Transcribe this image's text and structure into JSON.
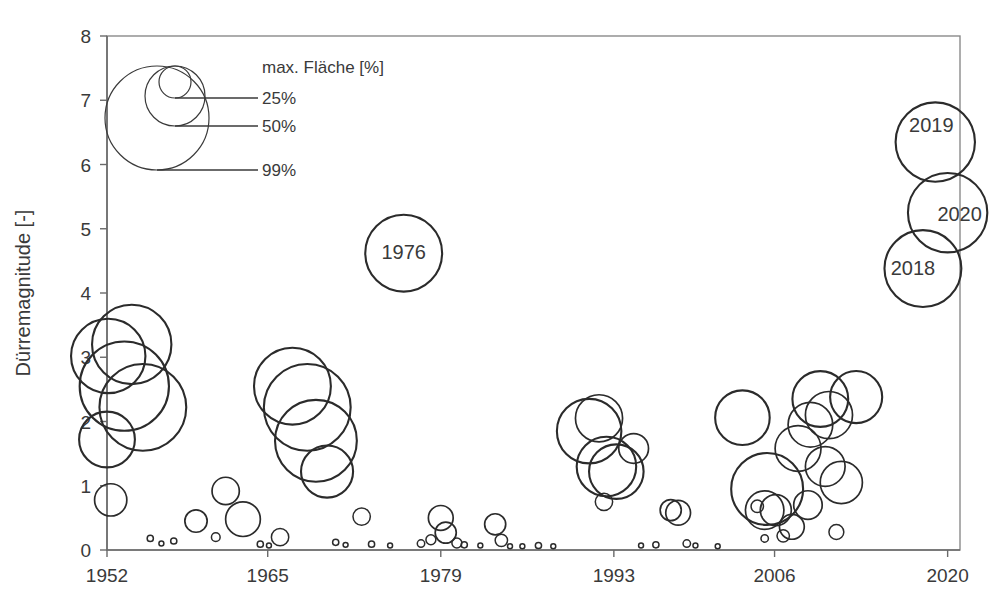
{
  "chart_data": {
    "type": "scatter",
    "title": "",
    "xlabel": "",
    "ylabel": "Dürremagnitude [-]",
    "xlim": [
      1952,
      2021
    ],
    "ylim": [
      0,
      8
    ],
    "grid": false,
    "legend_position": "top-left inside",
    "size_encoding": "max. Fläche [%]",
    "x_ticks": [
      "1952",
      "1965",
      "1979",
      "1993",
      "2006",
      "2020"
    ],
    "x_tick_values": [
      1952,
      1965,
      1979,
      1993,
      2006,
      2020
    ],
    "y_ticks": [
      "0",
      "1",
      "2",
      "3",
      "4",
      "5",
      "6",
      "7",
      "8"
    ],
    "y_tick_values": [
      0,
      1,
      2,
      3,
      4,
      5,
      6,
      7,
      8
    ],
    "legend": {
      "title": "max. Fläche [%]",
      "entries": [
        {
          "label": "25%",
          "value": 25
        },
        {
          "label": "50%",
          "value": 50
        },
        {
          "label": "99%",
          "value": 99
        }
      ]
    },
    "annotations": [
      {
        "label": "1976",
        "x": 1976,
        "y": 4.62
      },
      {
        "label": "2019",
        "x": 2019,
        "y": 6.35
      },
      {
        "label": "2020",
        "x": 2020,
        "y": 5.25
      },
      {
        "label": "2018",
        "x": 2018,
        "y": 4.38
      }
    ],
    "points": [
      {
        "x": 1952.1,
        "y": 3.02,
        "size": 60
      },
      {
        "x": 1952.0,
        "y": 1.72,
        "size": 45
      },
      {
        "x": 1952.3,
        "y": 0.78,
        "size": 26
      },
      {
        "x": 1953.4,
        "y": 2.55,
        "size": 72
      },
      {
        "x": 1954.0,
        "y": 3.2,
        "size": 64
      },
      {
        "x": 1954.9,
        "y": 2.22,
        "size": 70
      },
      {
        "x": 1955.5,
        "y": 0.18,
        "size": 5
      },
      {
        "x": 1956.4,
        "y": 0.1,
        "size": 4
      },
      {
        "x": 1957.4,
        "y": 0.14,
        "size": 5
      },
      {
        "x": 1959.2,
        "y": 0.45,
        "size": 18
      },
      {
        "x": 1960.8,
        "y": 0.2,
        "size": 7
      },
      {
        "x": 1961.6,
        "y": 0.92,
        "size": 22
      },
      {
        "x": 1963.0,
        "y": 0.48,
        "size": 28
      },
      {
        "x": 1964.4,
        "y": 0.09,
        "size": 5
      },
      {
        "x": 1965.1,
        "y": 0.07,
        "size": 4
      },
      {
        "x": 1966.0,
        "y": 0.2,
        "size": 14
      },
      {
        "x": 1967.0,
        "y": 2.55,
        "size": 62
      },
      {
        "x": 1968.2,
        "y": 2.22,
        "size": 70
      },
      {
        "x": 1968.9,
        "y": 1.7,
        "size": 66
      },
      {
        "x": 1969.8,
        "y": 1.22,
        "size": 42
      },
      {
        "x": 1970.5,
        "y": 0.12,
        "size": 5
      },
      {
        "x": 1971.3,
        "y": 0.08,
        "size": 4
      },
      {
        "x": 1972.6,
        "y": 0.52,
        "size": 14
      },
      {
        "x": 1973.4,
        "y": 0.09,
        "size": 5
      },
      {
        "x": 1974.9,
        "y": 0.07,
        "size": 4
      },
      {
        "x": 1976.0,
        "y": 4.62,
        "size": 62
      },
      {
        "x": 1977.4,
        "y": 0.1,
        "size": 6
      },
      {
        "x": 1978.2,
        "y": 0.16,
        "size": 8
      },
      {
        "x": 1979.0,
        "y": 0.5,
        "size": 20
      },
      {
        "x": 1979.4,
        "y": 0.27,
        "size": 17
      },
      {
        "x": 1980.3,
        "y": 0.11,
        "size": 8
      },
      {
        "x": 1980.9,
        "y": 0.08,
        "size": 5
      },
      {
        "x": 1982.2,
        "y": 0.07,
        "size": 4
      },
      {
        "x": 1983.4,
        "y": 0.4,
        "size": 17
      },
      {
        "x": 1983.9,
        "y": 0.15,
        "size": 10
      },
      {
        "x": 1984.6,
        "y": 0.06,
        "size": 4
      },
      {
        "x": 1985.6,
        "y": 0.06,
        "size": 4
      },
      {
        "x": 1986.9,
        "y": 0.07,
        "size": 5
      },
      {
        "x": 1988.1,
        "y": 0.06,
        "size": 4
      },
      {
        "x": 1991.0,
        "y": 1.85,
        "size": 52
      },
      {
        "x": 1991.8,
        "y": 2.05,
        "size": 38
      },
      {
        "x": 1992.4,
        "y": 1.3,
        "size": 48
      },
      {
        "x": 1993.2,
        "y": 1.22,
        "size": 44
      },
      {
        "x": 1992.2,
        "y": 0.75,
        "size": 14
      },
      {
        "x": 1994.6,
        "y": 1.58,
        "size": 24
      },
      {
        "x": 1995.2,
        "y": 0.07,
        "size": 4
      },
      {
        "x": 1996.4,
        "y": 0.08,
        "size": 5
      },
      {
        "x": 1997.6,
        "y": 0.62,
        "size": 17
      },
      {
        "x": 1998.2,
        "y": 0.58,
        "size": 20
      },
      {
        "x": 1998.9,
        "y": 0.1,
        "size": 6
      },
      {
        "x": 1999.6,
        "y": 0.07,
        "size": 4
      },
      {
        "x": 2001.4,
        "y": 0.06,
        "size": 4
      },
      {
        "x": 2003.4,
        "y": 2.06,
        "size": 44
      },
      {
        "x": 2005.4,
        "y": 0.95,
        "size": 58
      },
      {
        "x": 2005.2,
        "y": 0.62,
        "size": 31
      },
      {
        "x": 2004.6,
        "y": 0.68,
        "size": 10
      },
      {
        "x": 2006.1,
        "y": 0.62,
        "size": 25
      },
      {
        "x": 2005.2,
        "y": 0.18,
        "size": 6
      },
      {
        "x": 2006.7,
        "y": 0.22,
        "size": 10
      },
      {
        "x": 2007.4,
        "y": 0.36,
        "size": 20
      },
      {
        "x": 2007.9,
        "y": 1.58,
        "size": 37
      },
      {
        "x": 2008.7,
        "y": 0.7,
        "size": 23
      },
      {
        "x": 2008.9,
        "y": 1.95,
        "size": 36
      },
      {
        "x": 2009.7,
        "y": 2.35,
        "size": 45
      },
      {
        "x": 2010.4,
        "y": 2.1,
        "size": 38
      },
      {
        "x": 2010.1,
        "y": 1.3,
        "size": 32
      },
      {
        "x": 2011.4,
        "y": 1.05,
        "size": 34
      },
      {
        "x": 2011.0,
        "y": 0.28,
        "size": 12
      },
      {
        "x": 2012.6,
        "y": 2.38,
        "size": 42
      },
      {
        "x": 2018.0,
        "y": 4.38,
        "size": 62
      },
      {
        "x": 2019.0,
        "y": 6.35,
        "size": 64
      },
      {
        "x": 2020.0,
        "y": 5.25,
        "size": 64
      }
    ]
  },
  "axis": {
    "y_title": "Dürremagnitude [-]"
  }
}
